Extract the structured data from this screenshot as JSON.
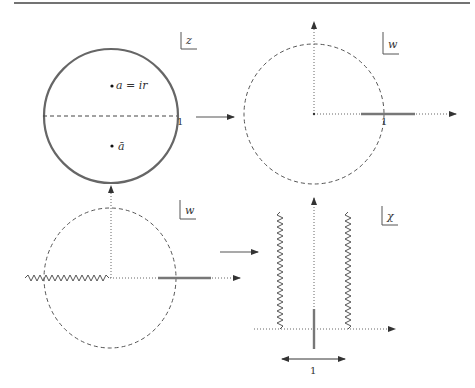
{
  "figure": {
    "colors": {
      "stroke": "#555555",
      "thick_segment": "#777777",
      "rule": "#444444"
    }
  },
  "panels": {
    "z": {
      "plane_label": "z",
      "point_a_label": "a = ir",
      "point_abar_label": "ā",
      "unit_label": "1"
    },
    "w_top": {
      "plane_label": "w",
      "unit_label": "1"
    },
    "w_bottom": {
      "plane_label": "w"
    },
    "chi": {
      "plane_label": "χ",
      "width_label": "1"
    }
  },
  "arrows": [
    {
      "from": "z",
      "to": "w_top",
      "direction": "right"
    },
    {
      "from": "w_bottom",
      "to": "chi",
      "direction": "right"
    },
    {
      "from": "w_bottom",
      "to": "z",
      "direction": "up"
    }
  ]
}
